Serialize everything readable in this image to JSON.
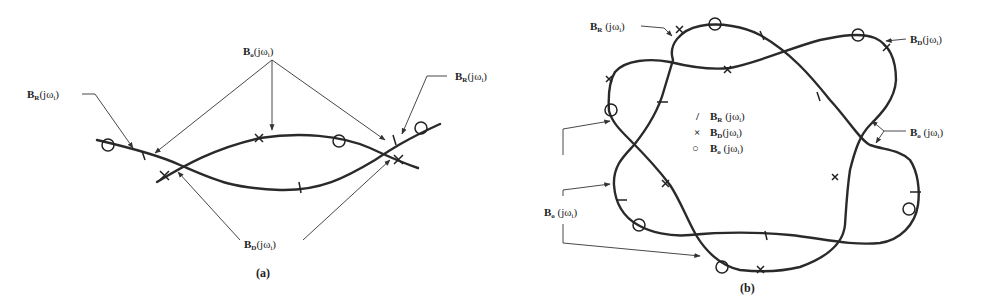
{
  "panel_a": {
    "caption": "(a)",
    "labels": {
      "bo_top": {
        "main": "B",
        "sub": "o",
        "arg": "(jω",
        "argsub": "i",
        "close": ")"
      },
      "br_left": {
        "main": "B",
        "sub": "R",
        "arg": "(jω",
        "argsub": "i",
        "close": ")"
      },
      "br_right": {
        "main": "B",
        "sub": "R",
        "arg": "(jω",
        "argsub": "i",
        "close": ")"
      },
      "bd_bottom": {
        "main": "B",
        "sub": "D",
        "arg": "(jω",
        "argsub": "i",
        "close": ")"
      }
    }
  },
  "panel_b": {
    "caption": "(b)",
    "labels": {
      "br_top": {
        "main": "B",
        "sub": "R",
        "arg": " (jω",
        "argsub": "i",
        "close": ")"
      },
      "bd_top_right": {
        "main": "B",
        "sub": "D",
        "arg": "(jω",
        "argsub": "i",
        "close": ")"
      },
      "bo_right": {
        "main": "B",
        "sub": "o",
        "arg": " (jω",
        "argsub": "i",
        "close": ")"
      },
      "bo_left": {
        "main": "B",
        "sub": "o",
        "arg": " (jω",
        "argsub": "i",
        "close": ")"
      }
    },
    "legend": [
      {
        "symbol": "/",
        "main": "B",
        "sub": "R",
        "arg": " (jω",
        "argsub": "i",
        "close": ")"
      },
      {
        "symbol": "×",
        "main": "B",
        "sub": "D",
        "arg": "(jω",
        "argsub": "i",
        "close": ")"
      },
      {
        "symbol": "○",
        "main": "B",
        "sub": "o",
        "arg": " (jω",
        "argsub": "i",
        "close": ")"
      }
    ]
  },
  "colors": {
    "ink": "#2a2a2a",
    "background": "#ffffff"
  }
}
